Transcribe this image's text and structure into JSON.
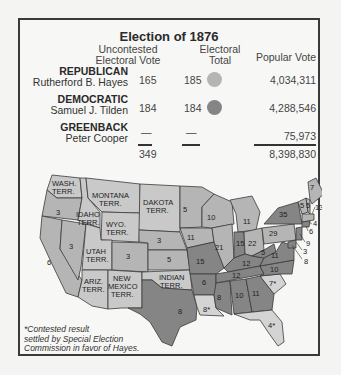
{
  "title": "Election of 1876",
  "headers": {
    "uncontested": [
      "Uncontested",
      "Electoral Vote"
    ],
    "electoral_total": [
      "Electoral",
      "Total"
    ],
    "popular_vote": "Popular Vote"
  },
  "candidates": [
    {
      "party": "REPUBLICAN",
      "name": "Rutherford B. Hayes",
      "uncontested": "165",
      "total": "185",
      "popular": "4,034,311",
      "color": "#b5b5b5"
    },
    {
      "party": "DEMOCRATIC",
      "name": "Samuel J. Tilden",
      "uncontested": "184",
      "total": "184",
      "popular": "4,288,546",
      "color": "#858585"
    },
    {
      "party": "GREENBACK",
      "name": "Peter Cooper",
      "uncontested": "—",
      "total": "—",
      "popular": "75,973"
    }
  ],
  "totals": {
    "uncontested": "349",
    "popular": "8,398,830"
  },
  "colors": {
    "republican": "#b5b5b5",
    "democratic": "#858585",
    "territory": "#c9c9c9",
    "contested": "#d4d4d4",
    "border": "#3a3a3a"
  },
  "map": {
    "territories": [
      "WASH. TERR.",
      "MONTANA TERR.",
      "DAKOTA TERR.",
      "IDAHO TERR.",
      "WYO. TERR.",
      "UTAH TERR.",
      "ARIZ. TERR.",
      "NEW MEXICO TERR.",
      "INDIAN TERR."
    ],
    "state_votes": {
      "oregon": "3",
      "california": "6",
      "nevada": "3",
      "colorado": "3",
      "nebraska": "3",
      "kansas": "5",
      "minnesota": "5",
      "iowa": "11",
      "missouri": "15",
      "wisconsin": "10",
      "michigan": "11",
      "illinois": "21",
      "indiana": "15",
      "ohio": "22",
      "pennsylvania": "29",
      "new_york": "35",
      "texas": "8",
      "arkansas": "6",
      "louisiana": "8*",
      "mississippi": "8",
      "alabama": "10",
      "georgia": "11",
      "florida": "4*",
      "south_carolina": "7*",
      "north_carolina": "10",
      "virginia": "11",
      "west_virginia": "5",
      "kentucky": "12",
      "tennessee": "12",
      "maine": "7",
      "new_hampshire": "5",
      "vermont": "5",
      "massachusetts": "13",
      "rhode_island": "4",
      "connecticut": "6",
      "new_jersey": "9",
      "delaware": "3",
      "maryland": "8"
    }
  },
  "footnote": [
    "*Contested result",
    "settled by Special Election",
    "Commission in favor of Hayes."
  ]
}
